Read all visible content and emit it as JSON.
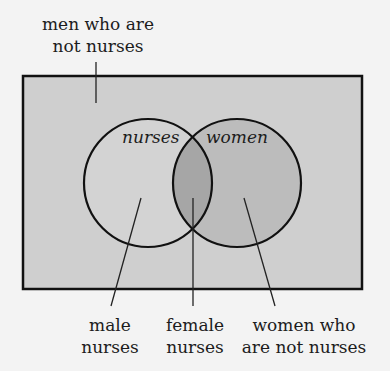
{
  "diagram": {
    "type": "venn",
    "universe_label": [
      "men who are",
      "not nurses"
    ],
    "sets": [
      {
        "name": "nurses",
        "label": "nurses"
      },
      {
        "name": "women",
        "label": "women"
      }
    ],
    "region_labels": {
      "male_nurses": [
        "male",
        "nurses"
      ],
      "female_nurses": [
        "female",
        "nurses"
      ],
      "women_not_nurses": [
        "women who",
        "are not nurses"
      ]
    },
    "colors": {
      "page_background": "#f3f3f3",
      "universe_fill": "#cfcfcf",
      "nurses_only_fill": "#d3d3d3",
      "women_only_fill": "#bcbcbc",
      "intersection_fill": "#a6a6a6",
      "stroke": "#111111"
    }
  }
}
